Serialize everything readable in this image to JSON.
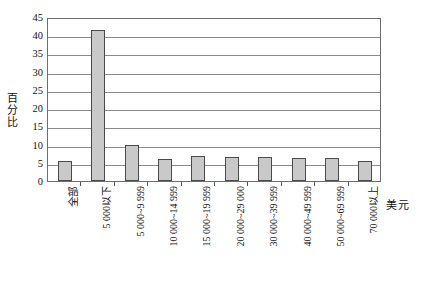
{
  "chart_data": {
    "type": "bar",
    "title": "",
    "subtitle": "",
    "xlabel": "美元",
    "ylabel": "百分比",
    "ylim": [
      0,
      45
    ],
    "ytick_step": 5,
    "yticks": [
      "45",
      "40",
      "35",
      "30",
      "25",
      "20",
      "15",
      "10",
      "5",
      "0"
    ],
    "grid": true,
    "legend": null,
    "categories": [
      "全部",
      "5 000以下",
      "5 000~9 999",
      "10 000~14 999",
      "15 000~19 999",
      "20 000~29 000",
      "30 000~39 999",
      "40 000~49 999",
      "50 000~69 999",
      "70 000以上"
    ],
    "values": [
      5.5,
      41.5,
      10.0,
      6.0,
      6.8,
      6.5,
      6.5,
      6.2,
      6.2,
      5.5
    ],
    "bar_fill": "#c9c9c9",
    "bar_border": "#4a4a4a",
    "grid_color": "#8a8a8a",
    "frame_color": "#6e6e6e",
    "background": "#ffffff"
  }
}
